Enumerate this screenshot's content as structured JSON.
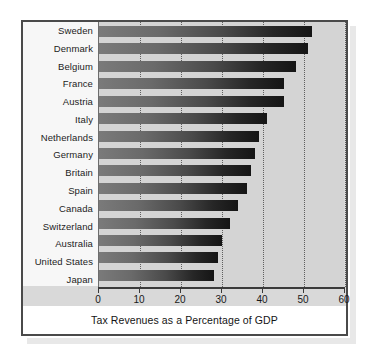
{
  "chart_data": {
    "type": "bar",
    "orientation": "horizontal",
    "title": "",
    "xlabel": "Tax Revenues as a Percentage of GDP",
    "ylabel": "",
    "xlim": [
      0,
      60
    ],
    "xticks": [
      0,
      10,
      20,
      30,
      40,
      50,
      60
    ],
    "xticklabels": [
      "0",
      "10",
      "20",
      "30",
      "40",
      "50",
      "60"
    ],
    "grid": "vertical-dotted",
    "legend": "none",
    "categories": [
      "Sweden",
      "Denmark",
      "Belgium",
      "France",
      "Austria",
      "Italy",
      "Netherlands",
      "Germany",
      "Britain",
      "Spain",
      "Canada",
      "Switzerland",
      "Australia",
      "United States",
      "Japan"
    ],
    "values": [
      52,
      51,
      48,
      45,
      45,
      41,
      39,
      38,
      37,
      36,
      34,
      32,
      30,
      29,
      28
    ],
    "bar_color_left": "#7a7a7a",
    "bar_color_right": "#151515",
    "plot_background": "#d4d4d4",
    "frame_color": "#4a4a4a"
  },
  "figure": {
    "axis_title": "Tax Revenues as a Percentage of GDP"
  }
}
